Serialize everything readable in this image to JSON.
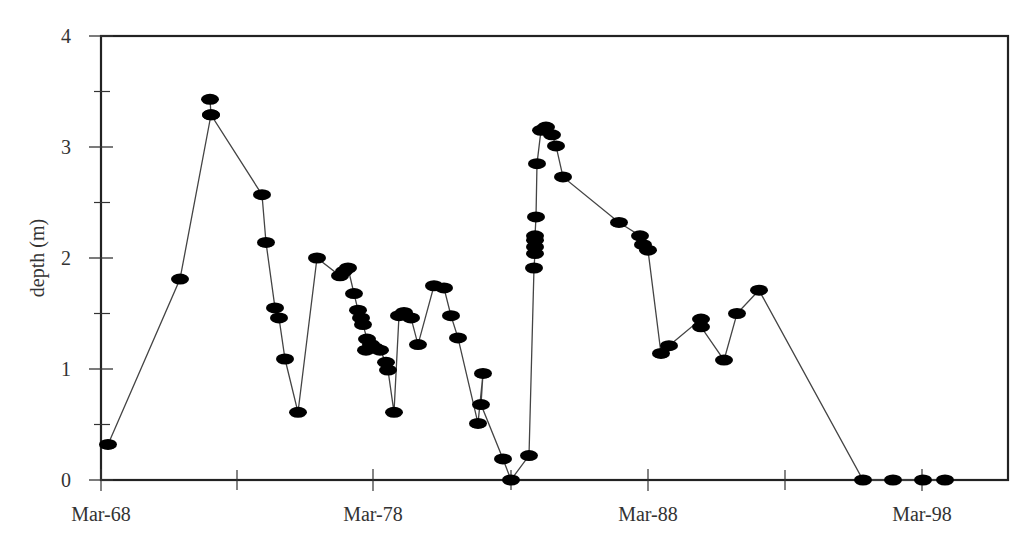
{
  "chart_data": {
    "type": "line",
    "title": "",
    "xlabel": "",
    "ylabel": "depth (m)",
    "ylim": [
      0,
      4
    ],
    "xlim_labels": [
      "Mar-68",
      "Mar-98"
    ],
    "grid": false,
    "legend": null,
    "y_ticks": [
      0,
      1,
      2,
      3,
      4
    ],
    "y_minor_ticks": [
      0.5,
      1.5,
      2.5,
      3.5
    ],
    "x_tick_labels": [
      {
        "label": "Mar-68",
        "x": 101
      },
      {
        "label": "Mar-78",
        "x": 373
      },
      {
        "label": "Mar-88",
        "x": 648
      },
      {
        "label": "Mar-98",
        "x": 922
      }
    ],
    "x_minor_ticks_px": [
      237,
      511,
      785
    ],
    "marker": "filled-ellipse",
    "line_color": "#444444",
    "marker_color": "#000000",
    "series": [
      {
        "name": "depth",
        "points": [
          {
            "x": 108,
            "y": 0.32
          },
          {
            "x": 180,
            "y": 1.81
          },
          {
            "x": 211,
            "y": 3.29
          },
          {
            "x": 210,
            "y": 3.43
          },
          {
            "x": 211,
            "y": 3.29
          },
          {
            "x": 262,
            "y": 2.57
          },
          {
            "x": 266,
            "y": 2.14
          },
          {
            "x": 275,
            "y": 1.55
          },
          {
            "x": 279,
            "y": 1.46
          },
          {
            "x": 285,
            "y": 1.09
          },
          {
            "x": 298,
            "y": 0.61
          },
          {
            "x": 317,
            "y": 2.0
          },
          {
            "x": 340,
            "y": 1.84
          },
          {
            "x": 344,
            "y": 1.88
          },
          {
            "x": 348,
            "y": 1.91
          },
          {
            "x": 354,
            "y": 1.68
          },
          {
            "x": 358,
            "y": 1.53
          },
          {
            "x": 361,
            "y": 1.46
          },
          {
            "x": 363,
            "y": 1.4
          },
          {
            "x": 367,
            "y": 1.27
          },
          {
            "x": 371,
            "y": 1.22
          },
          {
            "x": 366,
            "y": 1.17
          },
          {
            "x": 375,
            "y": 1.19
          },
          {
            "x": 380,
            "y": 1.17
          },
          {
            "x": 386,
            "y": 1.06
          },
          {
            "x": 388,
            "y": 0.99
          },
          {
            "x": 394,
            "y": 0.61
          },
          {
            "x": 399,
            "y": 1.48
          },
          {
            "x": 404,
            "y": 1.51
          },
          {
            "x": 411,
            "y": 1.46
          },
          {
            "x": 418,
            "y": 1.22
          },
          {
            "x": 434,
            "y": 1.75
          },
          {
            "x": 444,
            "y": 1.73
          },
          {
            "x": 451,
            "y": 1.48
          },
          {
            "x": 458,
            "y": 1.28
          },
          {
            "x": 478,
            "y": 0.51
          },
          {
            "x": 483,
            "y": 0.96
          },
          {
            "x": 481,
            "y": 0.68
          },
          {
            "x": 503,
            "y": 0.19
          },
          {
            "x": 511,
            "y": 0.0
          },
          {
            "x": 529,
            "y": 0.22
          },
          {
            "x": 534,
            "y": 1.91
          },
          {
            "x": 535,
            "y": 2.04
          },
          {
            "x": 535,
            "y": 2.1
          },
          {
            "x": 535,
            "y": 2.16
          },
          {
            "x": 535,
            "y": 2.2
          },
          {
            "x": 536,
            "y": 2.37
          },
          {
            "x": 537,
            "y": 2.85
          },
          {
            "x": 541,
            "y": 3.15
          },
          {
            "x": 546,
            "y": 3.18
          },
          {
            "x": 552,
            "y": 3.11
          },
          {
            "x": 556,
            "y": 3.01
          },
          {
            "x": 563,
            "y": 2.73
          },
          {
            "x": 619,
            "y": 2.32
          },
          {
            "x": 640,
            "y": 2.2
          },
          {
            "x": 643,
            "y": 2.12
          },
          {
            "x": 648,
            "y": 2.07
          },
          {
            "x": 661,
            "y": 1.14
          },
          {
            "x": 669,
            "y": 1.21
          },
          {
            "x": 701,
            "y": 1.45
          },
          {
            "x": 701,
            "y": 1.38
          },
          {
            "x": 724,
            "y": 1.08
          },
          {
            "x": 737,
            "y": 1.5
          },
          {
            "x": 759,
            "y": 1.71
          },
          {
            "x": 863,
            "y": 0.0
          },
          {
            "x": 893,
            "y": 0.0
          },
          {
            "x": 923,
            "y": 0.0
          },
          {
            "x": 945,
            "y": 0.0
          }
        ]
      }
    ],
    "plot_area_px": {
      "left": 101,
      "top": 36,
      "right": 1008,
      "bottom": 480
    }
  },
  "axis": {
    "y_title": "depth (m)",
    "y_tick_labels": [
      "0",
      "1",
      "2",
      "3",
      "4"
    ],
    "x_tick_labels": [
      "Mar-68",
      "Mar-78",
      "Mar-88",
      "Mar-98"
    ]
  }
}
